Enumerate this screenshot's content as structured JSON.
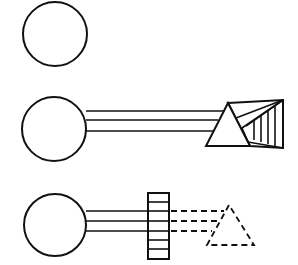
{
  "diagram": {
    "colors": {
      "ink": "#111111",
      "background": "#ffffff"
    },
    "panels": [
      {
        "id": "source-only",
        "elements": [
          "light-source-circle"
        ]
      },
      {
        "id": "source-beam-prism",
        "elements": [
          "light-source-circle",
          "beam-three-lines",
          "prism-triangle",
          "spectrum-fan"
        ]
      },
      {
        "id": "source-beam-filter",
        "elements": [
          "light-source-circle",
          "beam-three-lines",
          "hatched-filter-block",
          "dashed-beam",
          "dashed-prism-triangle"
        ]
      }
    ]
  }
}
